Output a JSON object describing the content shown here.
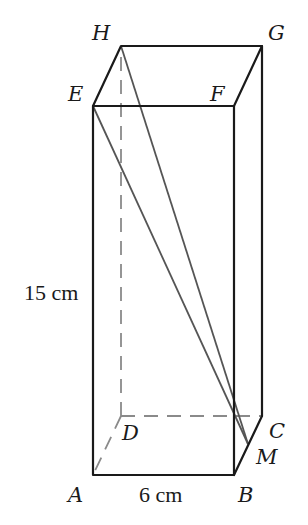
{
  "diagram": {
    "type": "cuboid",
    "vertices": {
      "A": "A",
      "B": "B",
      "C": "C",
      "D": "D",
      "E": "E",
      "F": "F",
      "G": "G",
      "H": "H",
      "M": "M"
    },
    "measurements": {
      "width": "6 cm",
      "height": "15 cm"
    },
    "segments": [
      "EM",
      "HM"
    ],
    "hidden_edges": [
      "AD",
      "DC",
      "DH"
    ]
  }
}
